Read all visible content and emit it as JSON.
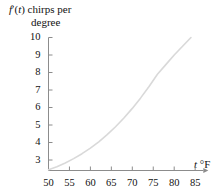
{
  "figure": {
    "y_axis_title_line1": "f′(t) chirps per",
    "y_axis_title_line2": "degree",
    "x_axis_title": "t °F"
  },
  "chart_data": {
    "type": "line",
    "title": "",
    "xlabel": "t °F",
    "ylabel": "f'(t) chirps per degree",
    "xlim": [
      50,
      86
    ],
    "ylim": [
      2.4,
      10.2
    ],
    "grid": false,
    "legend": "none",
    "xticks": [
      50,
      55,
      60,
      65,
      70,
      75,
      80,
      85
    ],
    "xtick_labels": [
      "50",
      "55",
      "60",
      "65",
      "70",
      "75",
      "80",
      "85"
    ],
    "yticks": [
      3,
      4,
      5,
      6,
      7,
      8,
      9,
      10
    ],
    "ytick_labels": [
      "3",
      "4",
      "5",
      "6",
      "7",
      "8",
      "9",
      "10"
    ],
    "series": [
      {
        "name": "f'(t)",
        "color": "#d9d9d9",
        "x": [
          50,
          52,
          54,
          56,
          58,
          60,
          62,
          64,
          66,
          68,
          70,
          72,
          74,
          76,
          78,
          80,
          82,
          84
        ],
        "y": [
          2.45,
          2.62,
          2.83,
          3.08,
          3.36,
          3.68,
          4.04,
          4.45,
          4.9,
          5.4,
          5.95,
          6.55,
          7.2,
          7.9,
          8.45,
          9.0,
          9.5,
          10.0
        ]
      }
    ]
  },
  "colors": {
    "axis": "#8c8c8c",
    "curve": "#d9d9d9",
    "text": "#111111"
  }
}
